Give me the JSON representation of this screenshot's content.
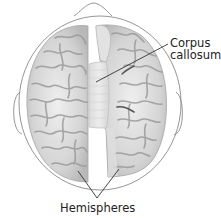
{
  "figure": {
    "labels": {
      "corpus_callosum_line1": "Corpus",
      "corpus_callosum_line2": "callosum",
      "hemispheres": "Hemispheres"
    },
    "colors": {
      "outline": "#8a8a8a",
      "brain_fill": "#d9d9d9",
      "brain_shadow": "#9c9c9c",
      "corpus_fill": "#e4e4e4",
      "leader_line": "#333333",
      "text": "#222222",
      "background": "#ffffff"
    }
  }
}
